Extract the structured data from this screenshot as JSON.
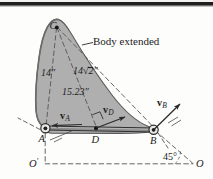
{
  "figure": {
    "background_color": "#fdfdfc",
    "body_fill_color": "#a9a9a9",
    "body_stroke_color": "#4a4a4a",
    "ink_color": "#1c1c1c",
    "annotation": {
      "body_extended_label": "Body extended"
    },
    "points": [
      {
        "id": "C",
        "label": "C"
      },
      {
        "id": "A",
        "label": "A"
      },
      {
        "id": "D",
        "label": "D"
      },
      {
        "id": "B",
        "label": "B"
      },
      {
        "id": "Oprime",
        "label": "O",
        "prime": "′"
      },
      {
        "id": "O",
        "label": "O"
      }
    ],
    "dimensions": [
      {
        "id": "CA",
        "label": "14″"
      },
      {
        "id": "CB",
        "label_prefix": "14",
        "label_radical": "√2",
        "label_suffix": "″",
        "label_plain": "14√2″"
      },
      {
        "id": "CD",
        "label": "15.23″"
      }
    ],
    "vectors": [
      {
        "id": "vA",
        "symbol": "v",
        "subscript": "A"
      },
      {
        "id": "vD",
        "symbol": "v",
        "subscript": "D"
      },
      {
        "id": "vB",
        "symbol": "v",
        "subscript": "B"
      }
    ],
    "angles": [
      {
        "id": "angle-O",
        "label": "45°"
      }
    ],
    "markers": {
      "right_angle_at_D": true,
      "pin_joint_A": true,
      "pin_joint_B": true
    }
  }
}
